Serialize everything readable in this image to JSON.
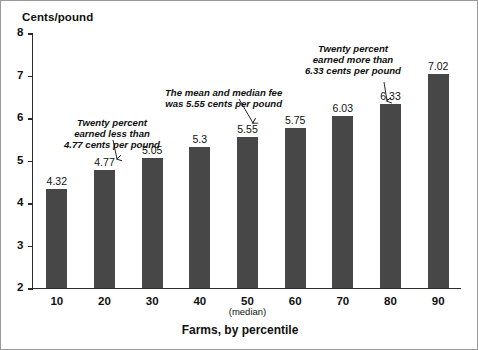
{
  "chart_data": {
    "type": "bar",
    "title": "",
    "ylabel": "Cents/pound",
    "xlabel": "Farms, by percentile",
    "categories": [
      "10",
      "20",
      "30",
      "40",
      "50",
      "60",
      "70",
      "80",
      "90"
    ],
    "category_sublabels": [
      "",
      "",
      "",
      "",
      "(median)",
      "",
      "",
      "",
      ""
    ],
    "values": [
      4.32,
      4.77,
      5.05,
      5.3,
      5.55,
      5.75,
      6.03,
      6.33,
      7.02
    ],
    "value_labels": [
      "4.32",
      "4.77",
      "5.05",
      "5.3",
      "5.55",
      "5.75",
      "6.03",
      "6.33",
      "7.02"
    ],
    "ylim": [
      2,
      8
    ],
    "yticks": [
      8,
      7,
      6,
      5,
      4,
      3,
      2
    ],
    "ytick_labels": [
      "8",
      "7",
      "6",
      "5",
      "4",
      "3",
      "2"
    ],
    "grid": false,
    "legend": null,
    "bar_color": "#474747",
    "axis_color": "#2b2b2b",
    "annotations": [
      {
        "id": "annotation-p20",
        "lines": [
          "Twenty percent",
          "earned less than",
          "4.77 cents per pound"
        ],
        "points_to_category": "20",
        "points_to_value": 4.77
      },
      {
        "id": "annotation-median",
        "lines": [
          "The mean and median fee",
          "was 5.55 cents per pound"
        ],
        "points_to_category": "50",
        "points_to_value": 5.55
      },
      {
        "id": "annotation-p80",
        "lines": [
          "Twenty percent",
          "earned more than",
          "6.33 cents per pound"
        ],
        "points_to_category": "80",
        "points_to_value": 6.33
      }
    ]
  }
}
